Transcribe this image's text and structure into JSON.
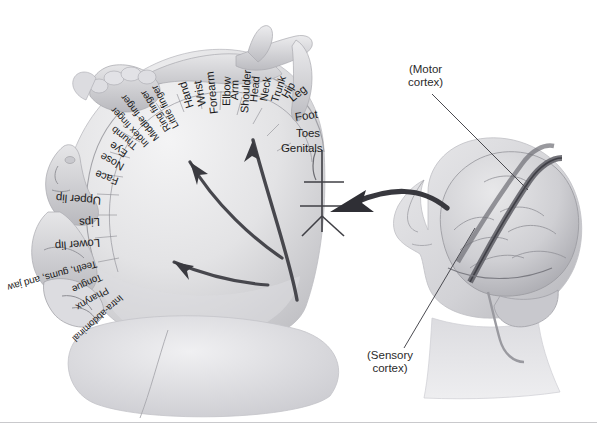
{
  "figure": {
    "background_color": "#ffffff",
    "label_color": "#1b1b1b",
    "arrow_color": "#3d3d42",
    "leader_color": "#4a4a50",
    "brain_tone_light": "#d8d8da",
    "brain_tone_mid": "#b6b6ba",
    "brain_tone_dark": "#8d8d93",
    "rule_color": "#c9c9cc"
  },
  "cortex_strip": {
    "labels": [
      {
        "text": "Toes",
        "x": 296,
        "y": 133,
        "rot": 0,
        "size": 11.5
      },
      {
        "text": "Foot",
        "x": 295,
        "y": 117,
        "rot": -8,
        "size": 11.5
      },
      {
        "text": "Leg",
        "x": 290,
        "y": 99,
        "rot": -38,
        "size": 11.5
      },
      {
        "text": "Hip",
        "x": 284,
        "y": 97,
        "rot": -60,
        "size": 11
      },
      {
        "text": "Trunk",
        "x": 274,
        "y": 102,
        "rot": -72,
        "size": 11
      },
      {
        "text": "Neck",
        "x": 263,
        "y": 101,
        "rot": -80,
        "size": 11
      },
      {
        "text": "Head",
        "x": 253,
        "y": 102,
        "rot": -84,
        "size": 11
      },
      {
        "text": "Shoulder",
        "x": 244,
        "y": 113,
        "rot": -86,
        "size": 11
      },
      {
        "text": "Arm",
        "x": 234,
        "y": 100,
        "rot": -88,
        "size": 11
      },
      {
        "text": "Elbow",
        "x": 226,
        "y": 106,
        "rot": -89,
        "size": 11
      },
      {
        "text": "Forearm",
        "x": 214,
        "y": 114,
        "rot": -96,
        "size": 11.5
      },
      {
        "text": "Wrist",
        "x": 202,
        "y": 106,
        "rot": -101,
        "size": 11.5
      },
      {
        "text": "Hand",
        "x": 190,
        "y": 108,
        "rot": -107,
        "size": 11.5
      },
      {
        "text": "Little finger",
        "x": 176,
        "y": 128,
        "rot": -118,
        "size": 10
      },
      {
        "text": "Ring finger",
        "x": 168,
        "y": 131,
        "rot": -123,
        "size": 10
      },
      {
        "text": "Middle finger",
        "x": 157,
        "y": 140,
        "rot": -128,
        "size": 10
      },
      {
        "text": "Index finger",
        "x": 147,
        "y": 146,
        "rot": -133,
        "size": 10
      },
      {
        "text": "Thumb",
        "x": 136,
        "y": 148,
        "rot": -140,
        "size": 10
      },
      {
        "text": "Eye",
        "x": 126,
        "y": 155,
        "rot": -146,
        "size": 11
      },
      {
        "text": "Nose",
        "x": 123,
        "y": 168,
        "rot": -151,
        "size": 11
      },
      {
        "text": "Face",
        "x": 118,
        "y": 182,
        "rot": -160,
        "size": 11
      },
      {
        "text": "Upper lip",
        "x": 101,
        "y": 201,
        "rot": -176,
        "size": 11.5
      },
      {
        "text": "Lips",
        "x": 100,
        "y": 222,
        "rot": 178,
        "size": 11.5
      },
      {
        "text": "Lower lip",
        "x": 100,
        "y": 243,
        "rot": 176,
        "size": 11.5
      },
      {
        "text": "Teeth, gums, and jaw",
        "x": 97,
        "y": 264,
        "rot": 165,
        "size": 10
      },
      {
        "text": "Tongue",
        "x": 102,
        "y": 277,
        "rot": 156,
        "size": 10
      },
      {
        "text": "Pharynx",
        "x": 108,
        "y": 290,
        "rot": 150,
        "size": 10
      },
      {
        "text": "Intra-abdominal",
        "x": 122,
        "y": 297,
        "rot": 138,
        "size": 9.5
      },
      {
        "text": "Genitals",
        "x": 281,
        "y": 148,
        "rot": 0,
        "size": 11.5
      }
    ]
  },
  "callouts": [
    {
      "name": "motor-cortex",
      "line1": "(Motor",
      "line2": "cortex)",
      "x": 408,
      "y": 63,
      "leader": {
        "x1": 432,
        "y1": 94,
        "x2": 528,
        "y2": 190
      }
    },
    {
      "name": "sensory-cortex",
      "line1": "(Sensory",
      "line2": "cortex)",
      "x": 367,
      "y": 349,
      "leader": {
        "x1": 404,
        "y1": 348,
        "x2": 475,
        "y2": 228
      }
    }
  ],
  "arrows": {
    "cortex_arrows": [
      {
        "name": "arrow-to-leg-region",
        "path": "M 297 300 C 290 260 272 210 253 140"
      },
      {
        "name": "arrow-to-hand-region",
        "path": "M 282 258 C 255 240 215 205 190 162"
      },
      {
        "name": "arrow-to-jaw-region",
        "path": "M 268 285 C 240 283 205 275 174 262"
      }
    ],
    "magnify_arrow": {
      "name": "magnify-arrow",
      "path": "M 447 208 C 420 186 390 188 352 203"
    }
  },
  "decor": {
    "bottom_rule_y": 422
  }
}
